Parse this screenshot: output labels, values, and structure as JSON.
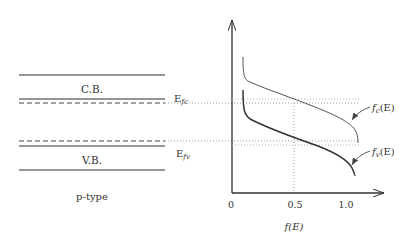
{
  "band_diagram": {
    "conduction_band_label": "C.B.",
    "valence_band_label": "V.B.",
    "fermi_c_label_main": "E",
    "fermi_c_label_sub": "fc",
    "fermi_v_label_main": "E",
    "fermi_v_label_sub": "fv",
    "type_label": "p-type"
  },
  "plot": {
    "x_ticks": [
      "0",
      "0.5",
      "1.0"
    ],
    "x_axis_label": "f(E)",
    "curve_c_label": "fс(E)",
    "curve_c_main": "f",
    "curve_c_sub": "c",
    "curve_c_tail": "(E)",
    "curve_v_main": "f",
    "curve_v_sub": "v",
    "curve_v_tail": "(E)"
  },
  "colors": {
    "line": "#333333",
    "light_line": "#555555",
    "dotted": "#888888"
  }
}
